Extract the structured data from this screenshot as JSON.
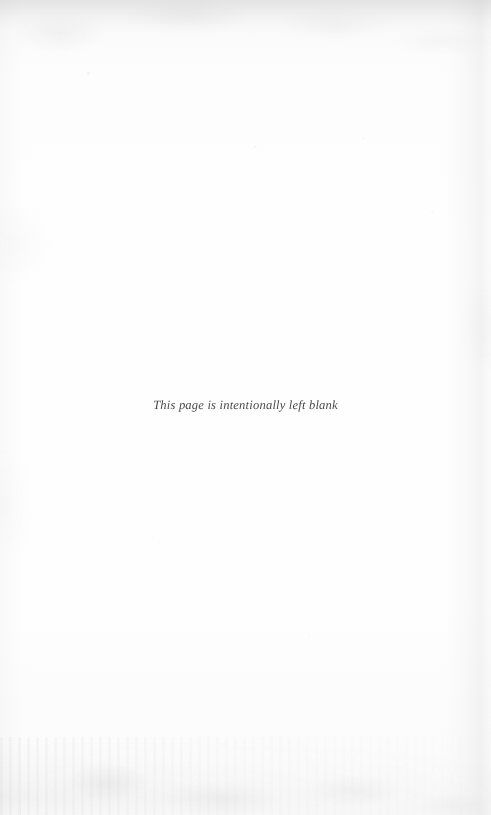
{
  "page": {
    "kind": "scanned-book-page",
    "width": 491,
    "height": 815,
    "paper_color": "#fdfdfc",
    "ink_color": "#3a3a38"
  },
  "notice": {
    "text": "This page is intentionally left blank"
  }
}
